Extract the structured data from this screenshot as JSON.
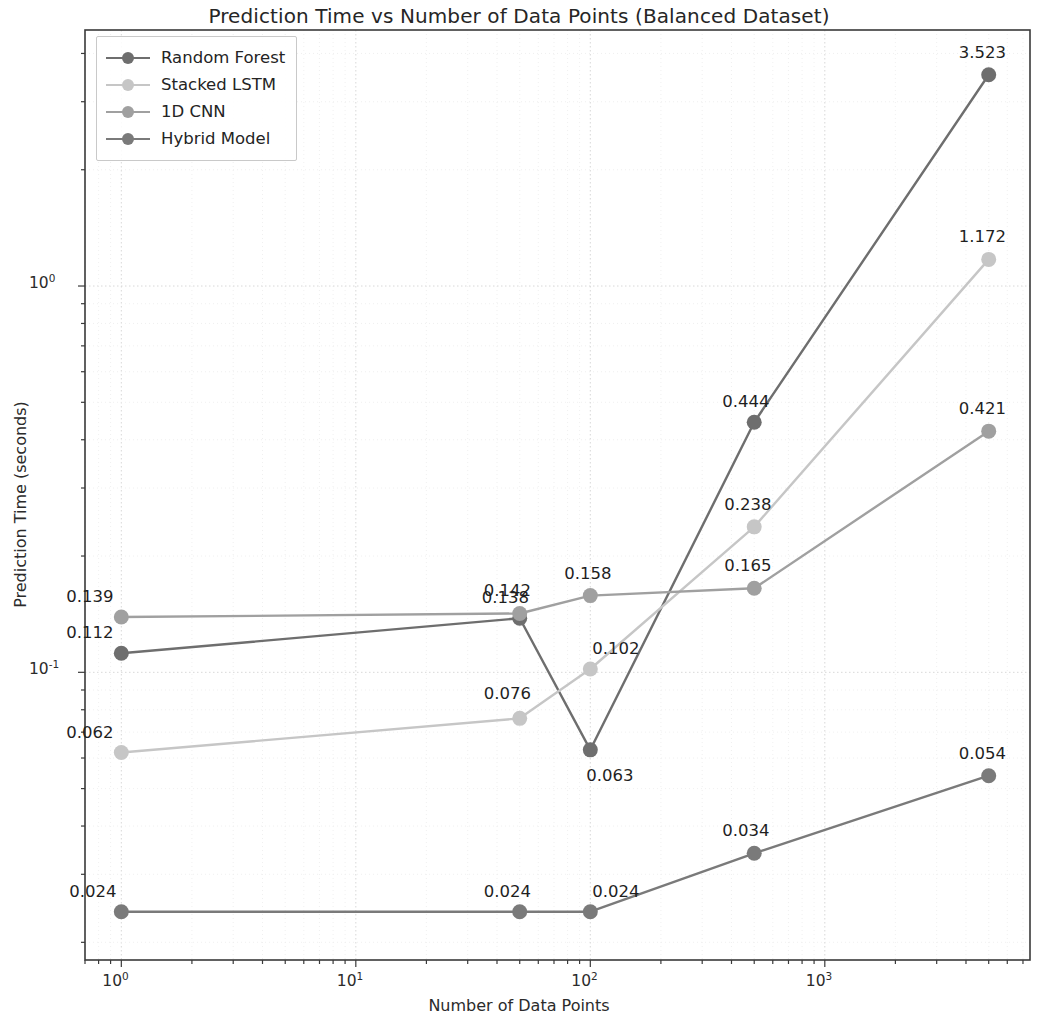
{
  "chart_data": {
    "type": "line",
    "title": "Prediction Time vs Number of Data Points (Balanced Dataset)",
    "xlabel": "Number of Data Points",
    "ylabel": "Prediction Time (seconds)",
    "xscale": "log",
    "yscale": "log",
    "xlim": [
      0.7,
      7500
    ],
    "ylim": [
      0.018,
      4.6
    ],
    "grid": true,
    "legend_position": "upper left",
    "x": [
      1,
      50,
      100,
      500,
      5000
    ],
    "xtick_labels": [
      "10",
      "10",
      "10",
      "10"
    ],
    "xtick_exponents": [
      "0",
      "1",
      "2",
      "3"
    ],
    "xtick_values": [
      1,
      10,
      100,
      1000
    ],
    "ytick_labels": [
      "10",
      "10"
    ],
    "ytick_exponents": [
      "0",
      "-1"
    ],
    "ytick_values": [
      1,
      0.1
    ],
    "series": [
      {
        "name": "Random Forest",
        "color": "#6e6e6e",
        "values": [
          0.112,
          0.138,
          0.063,
          0.444,
          3.523
        ],
        "labels": [
          "0.112",
          "0.138",
          "0.063",
          "0.444",
          "3.523"
        ]
      },
      {
        "name": "Stacked LSTM",
        "color": "#c6c6c6",
        "values": [
          0.062,
          0.076,
          0.102,
          0.238,
          1.172
        ],
        "labels": [
          "0.062",
          "0.076",
          "0.102",
          "0.238",
          "1.172"
        ]
      },
      {
        "name": "1D CNN",
        "color": "#a0a0a0",
        "values": [
          0.139,
          0.142,
          0.158,
          0.165,
          0.421
        ],
        "labels": [
          "0.139",
          "0.142",
          "0.158",
          "0.165",
          "0.421"
        ]
      },
      {
        "name": "Hybrid Model",
        "color": "#7a7a7a",
        "values": [
          0.024,
          0.024,
          0.024,
          0.034,
          0.054
        ],
        "labels": [
          "0.024",
          "0.024",
          "0.024",
          "0.034",
          "0.054"
        ]
      }
    ]
  },
  "legend": {
    "items": [
      {
        "label": "Random Forest"
      },
      {
        "label": "Stacked LSTM"
      },
      {
        "label": "1D CNN"
      },
      {
        "label": "Hybrid Model"
      }
    ]
  },
  "axes": {
    "title": "Prediction Time vs Number of Data Points (Balanced Dataset)",
    "x_title": "Number of Data Points",
    "y_title": "Prediction Time (seconds)"
  }
}
